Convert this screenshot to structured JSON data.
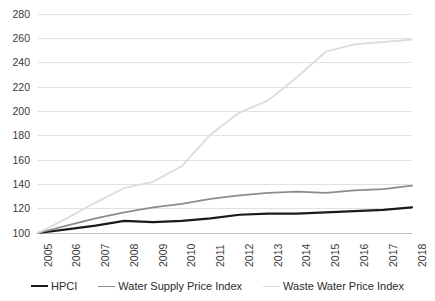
{
  "chart_data": {
    "type": "line",
    "title": "",
    "subtitle": "",
    "xlabel": "",
    "ylabel": "",
    "grid": true,
    "grid_orientation": "horizontal",
    "legend_position": "bottom",
    "x": [
      "2005",
      "2006",
      "2007",
      "2008",
      "2009",
      "2010",
      "2011",
      "2012",
      "2013",
      "2014",
      "2015",
      "2016",
      "2017",
      "2018"
    ],
    "categories": [
      "2005",
      "2006",
      "2007",
      "2008",
      "2009",
      "2010",
      "2011",
      "2012",
      "2013",
      "2014",
      "2015",
      "2016",
      "2017",
      "2018"
    ],
    "xlim": [
      2005,
      2018
    ],
    "ylim": [
      100,
      280
    ],
    "yticks": [
      100,
      120,
      140,
      160,
      180,
      200,
      220,
      240,
      260,
      280
    ],
    "xticks": [
      "2005",
      "2006",
      "2007",
      "2008",
      "2009",
      "2010",
      "2011",
      "2012",
      "2013",
      "2014",
      "2015",
      "2016",
      "2017",
      "2018"
    ],
    "series": [
      {
        "name": "HPCI",
        "color": "#1a1a1a",
        "width": 2.2,
        "values": [
          100,
          103,
          106,
          110,
          109,
          110,
          112,
          115,
          116,
          116,
          117,
          118,
          119,
          121
        ]
      },
      {
        "name": "Water Supply Price Index",
        "color": "#8c8c8c",
        "width": 1.8,
        "values": [
          100,
          106,
          112,
          117,
          121,
          124,
          128,
          131,
          133,
          134,
          133,
          135,
          136,
          139
        ]
      },
      {
        "name": "Waste Water Price Index",
        "color": "#dcdcdc",
        "width": 1.8,
        "values": [
          100,
          112,
          125,
          137,
          142,
          155,
          181,
          199,
          209,
          228,
          249,
          255,
          257,
          259
        ]
      }
    ]
  },
  "legend": {
    "items": [
      {
        "label": "HPCI",
        "color": "#1a1a1a",
        "width": 2.4
      },
      {
        "label": "Water Supply Price Index",
        "color": "#8c8c8c",
        "width": 1.8
      },
      {
        "label": "Waste Water Price Index",
        "color": "#dcdcdc",
        "width": 1.8
      }
    ]
  },
  "axes": {
    "y_tick_labels": [
      "280",
      "260",
      "240",
      "220",
      "200",
      "180",
      "160",
      "140",
      "120",
      "100"
    ],
    "x_tick_labels": [
      "2005",
      "2006",
      "2007",
      "2008",
      "2009",
      "2010",
      "2011",
      "2012",
      "2013",
      "2014",
      "2015",
      "2016",
      "2017",
      "2018"
    ]
  },
  "style": {
    "gridline_color": "#d9d9d9",
    "axis_line_color": "#bfbfbf",
    "background": "#ffffff",
    "text_color": "#3a3a3a"
  }
}
